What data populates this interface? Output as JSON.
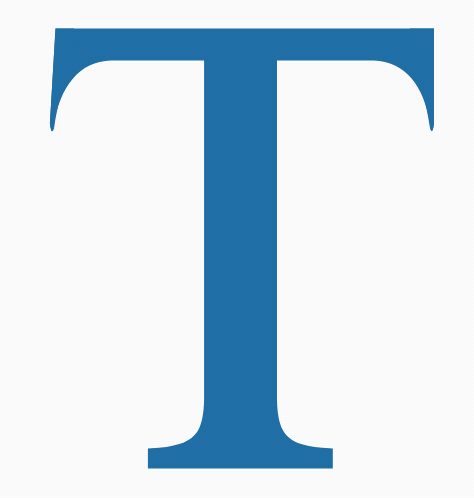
{
  "image": {
    "kind": "drop-cap-letter",
    "letter": "T",
    "description": "Large blue serif capital letter T",
    "width": 474,
    "height": 498,
    "background_color": "#fdfdfd",
    "letter_color": "#1f70a8",
    "typeface_style": "serif",
    "alt_text": "Blue serif capital letter T"
  },
  "geometry": {
    "crossbar": {
      "left_x": 55,
      "right_x": 434,
      "top_y": 28,
      "bottom_y": 63
    },
    "stem": {
      "left_x": 206,
      "right_x": 276,
      "top_y": 63,
      "bottom_y": 400
    },
    "foot_serif": {
      "left_x": 148,
      "right_x": 333,
      "baseline_y": 469
    },
    "serif_tips": {
      "left_tip_y": 131,
      "right_tip_y": 131
    }
  }
}
